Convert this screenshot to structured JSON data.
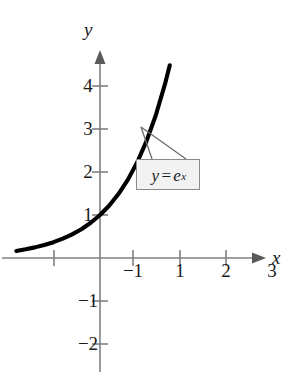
{
  "figure": {
    "background_color": "#ffffff",
    "curve_color": "#000000",
    "axis_color": "#808080",
    "text_color": "#1a1a1a",
    "callout": {
      "fill_color": "#f2f2f2",
      "border_color": "#8a8a8a",
      "lhs": "y",
      "operator": "=",
      "base": "e",
      "exponent": "x",
      "full_text": "y = e^x"
    }
  },
  "chart_data": {
    "type": "line",
    "title": "",
    "subtitle": "",
    "xlabel": "x",
    "ylabel": "y",
    "function": "y = e^x",
    "legend": [],
    "legend_position": "none",
    "grid": false,
    "annotations": [
      {
        "text": "y = e^x",
        "kind": "callout-box",
        "points_to_x": 0.9,
        "points_to_y": 2.45
      }
    ],
    "xlim": [
      -1.85,
      3.75
    ],
    "ylim": [
      -2.45,
      4.7
    ],
    "xticks": [
      -1,
      1,
      2,
      3
    ],
    "xtick_labels": [
      "-1",
      "1",
      "2",
      "3"
    ],
    "yticks": [
      -2,
      -1,
      1,
      2,
      3,
      4
    ],
    "ytick_labels": [
      "-2",
      "-1",
      "1",
      "2",
      "3",
      "4"
    ],
    "x_domain_drawn": [
      -1.8,
      1.5
    ],
    "series": [
      {
        "name": "y = e^x",
        "x": [
          -1.8,
          -1.6,
          -1.4,
          -1.2,
          -1.0,
          -0.8,
          -0.6,
          -0.4,
          -0.2,
          0.0,
          0.2,
          0.4,
          0.6,
          0.8,
          1.0,
          1.2,
          1.4,
          1.5
        ],
        "y": [
          0.165,
          0.202,
          0.247,
          0.301,
          0.368,
          0.449,
          0.549,
          0.67,
          0.819,
          1.0,
          1.221,
          1.492,
          1.822,
          2.226,
          2.718,
          3.32,
          4.055,
          4.482
        ]
      }
    ]
  },
  "axes": {
    "x_axis_name": "x-axis",
    "y_axis_name": "y-axis",
    "x_label": "x",
    "y_label": "y",
    "x_tick_labels": [
      {
        "value": "-1",
        "left": 133,
        "top": 271
      },
      {
        "value": "1",
        "left": 180,
        "top": 271
      },
      {
        "value": "2",
        "left": 226,
        "top": 271
      },
      {
        "value": "3",
        "left": 272,
        "top": 271
      }
    ],
    "y_tick_labels": [
      {
        "value": "4",
        "left": 88,
        "top": 86
      },
      {
        "value": "3",
        "left": 88,
        "top": 129
      },
      {
        "value": "2",
        "left": 88,
        "top": 172
      },
      {
        "value": "1",
        "left": 88,
        "top": 215
      },
      {
        "value": "-1",
        "left": 88,
        "top": 301
      },
      {
        "value": "-2",
        "left": 88,
        "top": 344
      }
    ]
  }
}
